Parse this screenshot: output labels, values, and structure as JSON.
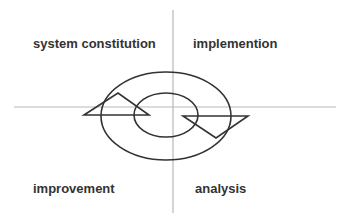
{
  "diagram": {
    "type": "cycle-quadrant",
    "quadrants": {
      "top_left": "system constitution",
      "top_right": "implemention",
      "bottom_left": "improvement",
      "bottom_right": "analysis"
    },
    "colors": {
      "axis": "#b0b0b0",
      "shape_stroke": "#333333",
      "text": "#333333",
      "background": "#ffffff"
    }
  }
}
